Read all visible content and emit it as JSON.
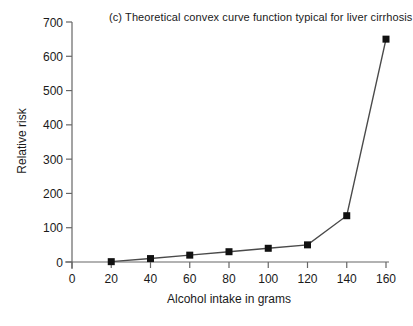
{
  "chart_data": {
    "type": "line",
    "title": "(c) Theoretical convex curve function typical for liver cirrhosis",
    "xlabel": "Alcohol intake in grams",
    "ylabel": "Relative risk",
    "x": [
      20,
      40,
      60,
      80,
      100,
      120,
      140,
      160
    ],
    "y": [
      1,
      10,
      20,
      30,
      40,
      50,
      135,
      650
    ],
    "xlim": [
      0,
      160
    ],
    "ylim": [
      0,
      700
    ],
    "xticks": [
      0,
      20,
      40,
      60,
      80,
      100,
      120,
      140,
      160
    ],
    "yticks": [
      0,
      100,
      200,
      300,
      400,
      500,
      600,
      700
    ],
    "grid": false,
    "legend_position": "none",
    "marker": "square",
    "colors": {
      "marker": "#111111",
      "line": "#4a4a4a",
      "axis": "#666666",
      "text": "#1a1a1a",
      "background": "#ffffff"
    }
  }
}
